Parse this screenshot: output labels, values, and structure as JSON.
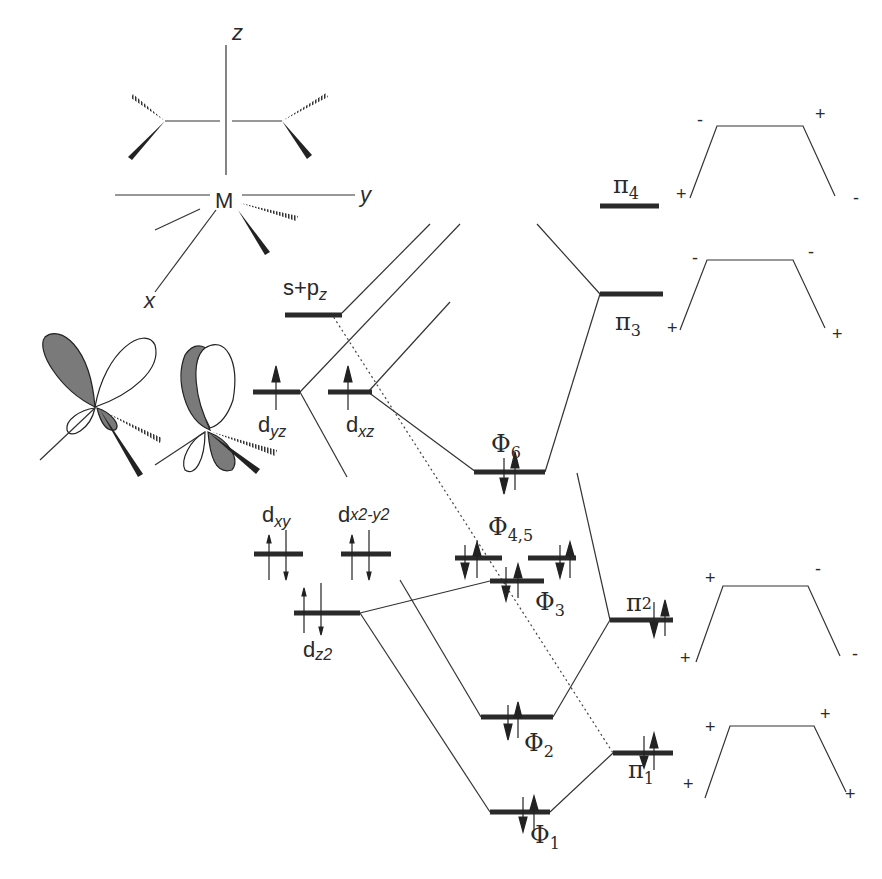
{
  "axes": {
    "z": "z",
    "y": "y",
    "x": "x",
    "metal": "M"
  },
  "labels": {
    "s_pz": {
      "base": "s+p",
      "sub": "z"
    },
    "dyz": {
      "base": "d",
      "sub": "yz"
    },
    "dxz": {
      "base": "d",
      "sub": "xz"
    },
    "dxy": {
      "base": "d",
      "sub": "xy"
    },
    "dx2y2": {
      "base": "d",
      "sub": "x2-y2"
    },
    "dz2": {
      "base": "d",
      "sub": "z2"
    },
    "phi6": {
      "base": "Φ",
      "sub": "6"
    },
    "phi45": {
      "base": "Φ",
      "sub": "4,5"
    },
    "phi3": {
      "base": "Φ",
      "sub": "3"
    },
    "phi2": {
      "base": "Φ",
      "sub": "2"
    },
    "phi1": {
      "base": "Φ",
      "sub": "1"
    },
    "pi4": {
      "base": "π",
      "sub": "4"
    },
    "pi3": {
      "base": "π",
      "sub": "3"
    },
    "pi2": {
      "base": "π",
      "sub": "2"
    },
    "pi1": {
      "base": "π",
      "sub": "1"
    }
  },
  "pi_signs": {
    "pi4": {
      "top_left": "-",
      "top_right": "+",
      "bottom_left": "+",
      "bottom_right": "-"
    },
    "pi3": {
      "top_left": "-",
      "top_right": "-",
      "bottom_left": "+",
      "bottom_right": "+"
    },
    "pi2": {
      "top_left": "+",
      "top_right": "-",
      "bottom_left": "+",
      "bottom_right": "-"
    },
    "pi1": {
      "top_left": "+",
      "top_right": "+",
      "bottom_left": "+",
      "bottom_right": "+"
    }
  },
  "occupancy": {
    "dyz": 1,
    "dxz": 1,
    "dxy": 2,
    "dx2y2": 2,
    "dz2": 2,
    "phi6": 2,
    "phi4": 2,
    "phi5": 2,
    "phi3": 2,
    "phi2": 2,
    "phi1": 2,
    "pi4": 0,
    "pi3": 0,
    "pi2": 2,
    "pi1": 2
  }
}
